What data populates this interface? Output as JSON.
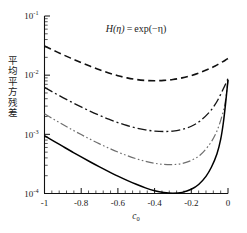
{
  "chart_data": {
    "type": "line",
    "title_parts": {
      "func": "H",
      "arg": "(η)",
      "eq": "=",
      "rhs": "exp(−η)"
    },
    "xlabel": "c",
    "xlabel_sub": "0",
    "ylabel": "平均平方残差",
    "xscale": "linear",
    "yscale": "log",
    "xlim": [
      -1.0,
      0.0
    ],
    "ylim": [
      0.0001,
      0.1
    ],
    "grid": false,
    "legend": "none",
    "xticks": [
      -1,
      -0.8,
      -0.6,
      -0.4,
      -0.2,
      0
    ],
    "xticklabels": [
      "-1",
      "-0.8",
      "-0.6",
      "-0.4",
      "-0.2",
      "0"
    ],
    "yticks": [
      0.1,
      0.01,
      0.001,
      0.0001
    ],
    "yticklabels": [
      "10",
      "10",
      "10",
      "10"
    ],
    "ytickexponents": [
      "-1",
      "-2",
      "-3",
      "-4"
    ],
    "xminor_count": 5,
    "series": [
      {
        "name": "curve-1",
        "style": "dashed",
        "color": "#111111",
        "width": 1.6,
        "dash": "7,4",
        "x": [
          -1.0,
          -0.95,
          -0.9,
          -0.85,
          -0.8,
          -0.75,
          -0.7,
          -0.65,
          -0.6,
          -0.55,
          -0.5,
          -0.45,
          -0.4,
          -0.35,
          -0.3,
          -0.25,
          -0.2,
          -0.15,
          -0.1,
          -0.07,
          -0.05,
          -0.03,
          -0.015,
          0.0
        ],
        "y": [
          0.031,
          0.0262,
          0.0222,
          0.019,
          0.0163,
          0.0141,
          0.0123,
          0.0109,
          0.0098,
          0.009,
          0.00845,
          0.00815,
          0.00805,
          0.00815,
          0.00845,
          0.009,
          0.00985,
          0.0111,
          0.0129,
          0.0143,
          0.0155,
          0.0168,
          0.0179,
          0.0192
        ]
      },
      {
        "name": "curve-2",
        "style": "dashdot",
        "color": "#151515",
        "width": 1.35,
        "dash": "9,3,2,3",
        "x": [
          -1.0,
          -0.95,
          -0.9,
          -0.85,
          -0.8,
          -0.75,
          -0.7,
          -0.65,
          -0.6,
          -0.55,
          -0.5,
          -0.45,
          -0.4,
          -0.35,
          -0.3,
          -0.25,
          -0.2,
          -0.15,
          -0.1,
          -0.07,
          -0.05,
          -0.03,
          -0.015,
          0.0
        ],
        "y": [
          0.0062,
          0.00508,
          0.00418,
          0.00347,
          0.0029,
          0.00245,
          0.00209,
          0.0018,
          0.00158,
          0.00141,
          0.00128,
          0.00119,
          0.001135,
          0.001115,
          0.001135,
          0.00121,
          0.00137,
          0.0017,
          0.0024,
          0.0032,
          0.0041,
          0.0055,
          0.0069,
          0.0088
        ]
      },
      {
        "name": "curve-3",
        "style": "dashdotdot",
        "color": "#6f6f6f",
        "width": 1.2,
        "dash": "8,2.5,1.6,2.5,1.6,2.5",
        "x": [
          -1.0,
          -0.95,
          -0.9,
          -0.85,
          -0.8,
          -0.75,
          -0.7,
          -0.65,
          -0.6,
          -0.55,
          -0.5,
          -0.45,
          -0.4,
          -0.35,
          -0.3,
          -0.25,
          -0.2,
          -0.15,
          -0.1,
          -0.07,
          -0.05,
          -0.03,
          -0.015,
          0.0
        ],
        "y": [
          0.00222,
          0.0018,
          0.001465,
          0.0012,
          0.00099,
          0.000823,
          0.00069,
          0.000585,
          0.000502,
          0.000437,
          0.000387,
          0.00035,
          0.000324,
          0.00031,
          0.000308,
          0.000322,
          0.000362,
          0.000452,
          0.00068,
          0.00098,
          0.00138,
          0.0022,
          0.0035,
          0.0082
        ]
      },
      {
        "name": "curve-4",
        "style": "solid",
        "color": "#000000",
        "width": 1.5,
        "dash": "none",
        "x": [
          -1.0,
          -0.95,
          -0.9,
          -0.85,
          -0.8,
          -0.75,
          -0.7,
          -0.65,
          -0.6,
          -0.55,
          -0.5,
          -0.45,
          -0.4,
          -0.35,
          -0.3,
          -0.25,
          -0.2,
          -0.16,
          -0.12,
          -0.09,
          -0.06,
          -0.04,
          -0.025,
          -0.012,
          0.0
        ],
        "y": [
          0.00095,
          0.00077,
          0.000625,
          0.000508,
          0.000415,
          0.000341,
          0.000282,
          0.000235,
          0.000197,
          0.000167,
          0.000143,
          0.0001245,
          0.0001115,
          0.000104,
          0.000101,
          0.0001045,
          0.000118,
          0.000142,
          0.000195,
          0.00028,
          0.00047,
          0.00082,
          0.0016,
          0.0036,
          0.0083
        ]
      }
    ]
  }
}
